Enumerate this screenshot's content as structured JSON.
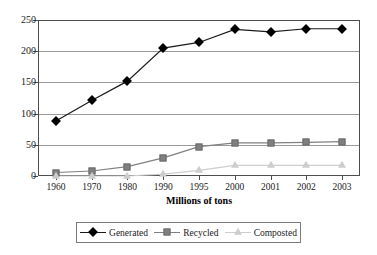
{
  "chart_data": {
    "type": "line",
    "title": "",
    "subtitle": "",
    "xlabel": "Millions of tons",
    "ylabel": "",
    "categories": [
      "1960",
      "1970",
      "1980",
      "1990",
      "1995",
      "2000",
      "2001",
      "2002",
      "2003"
    ],
    "ylim": [
      0,
      250
    ],
    "yticks": [
      0,
      50,
      100,
      150,
      200,
      250
    ],
    "ytick_labels": [
      "0",
      "50",
      "100",
      "150",
      "200",
      "250"
    ],
    "grid": "horizontal",
    "legend_position": "bottom",
    "series": [
      {
        "name": "Generated",
        "color": "#000000",
        "marker": "diamond",
        "values": [
          88,
          121,
          152,
          205,
          214,
          235,
          231,
          236,
          236
        ]
      },
      {
        "name": "Recycled",
        "color": "#808080",
        "marker": "square",
        "values": [
          5.6,
          8,
          15,
          29,
          47,
          53,
          53,
          54,
          55
        ]
      },
      {
        "name": "Composted",
        "color": "#cdcdcd",
        "marker": "triangle",
        "values": [
          0,
          0,
          0,
          3,
          9,
          17,
          17,
          17,
          17
        ]
      }
    ]
  },
  "axis": {
    "x_title": "Millions of tons"
  },
  "legend": {
    "items": [
      {
        "label": "Generated"
      },
      {
        "label": "Recycled"
      },
      {
        "label": "Composted"
      }
    ]
  }
}
